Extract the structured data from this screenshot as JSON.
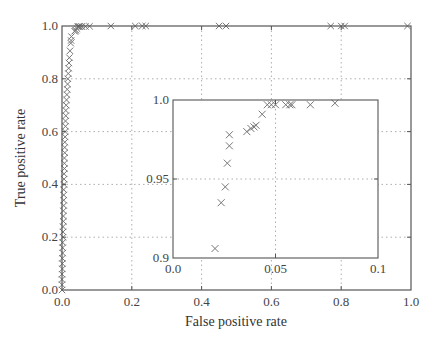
{
  "chart_data": [
    {
      "type": "scatter",
      "title": "",
      "xlabel": "False positive rate",
      "ylabel": "True positive rate",
      "xlim": [
        0.0,
        1.0
      ],
      "ylim": [
        0.0,
        1.0
      ],
      "grid": true,
      "marker": "x",
      "xticks": [
        "0.0",
        "0.2",
        "0.4",
        "0.6",
        "0.8",
        "1.0"
      ],
      "yticks": [
        "0.0",
        "0.2",
        "0.4",
        "0.6",
        "0.8",
        "1.0"
      ],
      "series": [
        {
          "name": "ROC",
          "x": [
            0.0,
            0.0,
            0.0,
            0.0,
            0.001,
            0.001,
            0.001,
            0.002,
            0.002,
            0.002,
            0.003,
            0.003,
            0.003,
            0.004,
            0.004,
            0.004,
            0.005,
            0.005,
            0.005,
            0.005,
            0.006,
            0.006,
            0.006,
            0.007,
            0.007,
            0.007,
            0.008,
            0.008,
            0.008,
            0.009,
            0.009,
            0.01,
            0.01,
            0.011,
            0.011,
            0.012,
            0.013,
            0.014,
            0.015,
            0.016,
            0.017,
            0.018,
            0.019,
            0.02,
            0.021,
            0.023,
            0.025,
            0.026,
            0.027,
            0.036,
            0.038,
            0.04,
            0.043,
            0.045,
            0.047,
            0.05,
            0.055,
            0.057,
            0.067,
            0.079,
            0.14,
            0.21,
            0.23,
            0.24,
            0.45,
            0.47,
            0.77,
            0.8,
            0.81,
            0.99
          ],
          "y": [
            0.0,
            0.02,
            0.04,
            0.06,
            0.08,
            0.1,
            0.12,
            0.14,
            0.16,
            0.18,
            0.2,
            0.22,
            0.24,
            0.26,
            0.28,
            0.3,
            0.32,
            0.34,
            0.36,
            0.38,
            0.4,
            0.42,
            0.44,
            0.46,
            0.48,
            0.5,
            0.52,
            0.54,
            0.56,
            0.58,
            0.6,
            0.62,
            0.64,
            0.66,
            0.68,
            0.7,
            0.72,
            0.74,
            0.76,
            0.78,
            0.8,
            0.82,
            0.84,
            0.86,
            0.88,
            0.906,
            0.935,
            0.945,
            0.96,
            0.98,
            0.982,
            0.984,
            0.99,
            0.997,
            0.998,
            0.998,
            0.998,
            0.998,
            0.998,
            0.999,
            1.0,
            1.0,
            1.0,
            1.0,
            1.0,
            1.0,
            1.0,
            1.0,
            1.0,
            1.0
          ]
        }
      ]
    },
    {
      "type": "scatter",
      "title": "inset (zoom)",
      "xlabel": "",
      "ylabel": "",
      "xlim": [
        0.0,
        0.1
      ],
      "ylim": [
        0.9,
        1.0
      ],
      "grid": true,
      "marker": "x",
      "xticks": [
        "0.0",
        "0.05",
        "0.1"
      ],
      "yticks": [
        "0.9",
        "0.95",
        "1.0"
      ],
      "series": [
        {
          "name": "ROC (zoomed)",
          "x": [
            0.0205,
            0.0235,
            0.0255,
            0.0265,
            0.0275,
            0.0275,
            0.036,
            0.038,
            0.0395,
            0.0405,
            0.0435,
            0.046,
            0.048,
            0.05,
            0.055,
            0.057,
            0.058,
            0.067,
            0.079
          ],
          "y": [
            0.906,
            0.935,
            0.945,
            0.96,
            0.971,
            0.978,
            0.98,
            0.982,
            0.983,
            0.984,
            0.991,
            0.997,
            0.997,
            0.997,
            0.997,
            0.997,
            0.997,
            0.997,
            0.998
          ]
        }
      ]
    }
  ],
  "axes": {
    "xlabel": "False positive rate",
    "ylabel": "True positive rate"
  }
}
